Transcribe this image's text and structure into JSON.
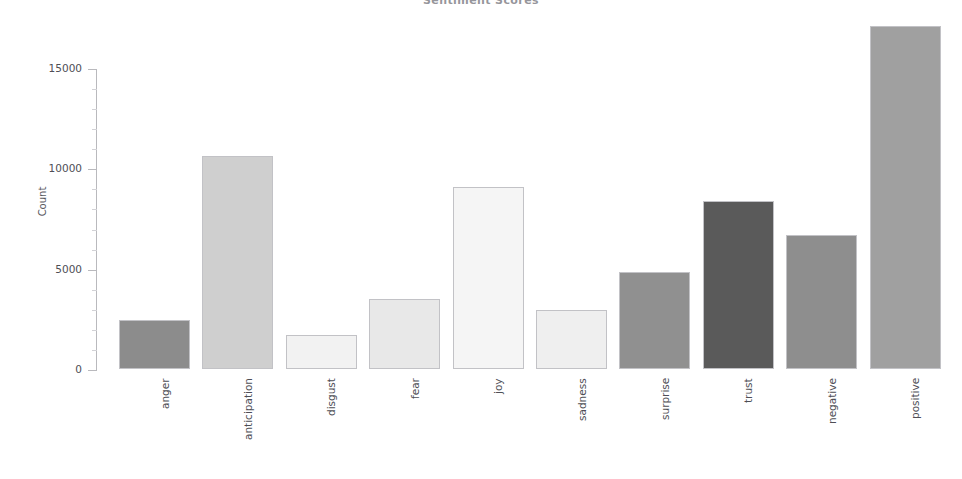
{
  "chart_data": {
    "type": "bar",
    "title": "Sentiment Scores",
    "xlabel": "",
    "ylabel": "Count",
    "categories": [
      "anger",
      "anticipation",
      "disgust",
      "fear",
      "joy",
      "sadness",
      "surprise",
      "trust",
      "negative",
      "positive"
    ],
    "values": [
      2450,
      10600,
      1700,
      3500,
      9050,
      2950,
      4850,
      8350,
      6700,
      17100
    ],
    "bar_colors": [
      "#8c8c8c",
      "#cfcfcf",
      "#f2f2f2",
      "#e8e8e8",
      "#f5f5f5",
      "#efefef",
      "#909090",
      "#5a5a5a",
      "#8e8e8e",
      "#a0a0a0"
    ],
    "ylim": [
      0,
      17800
    ],
    "yticks": [
      0,
      5000,
      10000,
      15000
    ],
    "ytick_labels": [
      "0",
      "5000",
      "10000",
      "15000"
    ],
    "grid": false,
    "legend": "none",
    "axis_color": "#b9b9bd"
  }
}
